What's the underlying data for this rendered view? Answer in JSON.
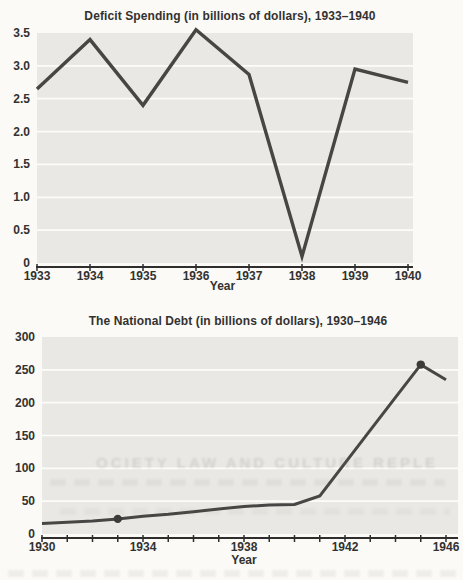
{
  "page": {
    "background_color": "#fbfaf7",
    "bleed_text": "OCIETY LAW AND CULTURE REPLE"
  },
  "colors": {
    "plot_bg": "#e9e8e4",
    "gridline": "#fcfcfa",
    "line": "#474644",
    "marker": "#3c3b39",
    "axis": "#2f2e2c",
    "text": "#333230"
  },
  "chart_data": [
    {
      "type": "line",
      "title": "Deficit Spending (in billions of dollars), 1933–1940",
      "xlabel": "Year",
      "ylabel": "",
      "x": [
        1933,
        1934,
        1935,
        1936,
        1937,
        1938,
        1939,
        1940
      ],
      "values": [
        2.65,
        3.4,
        2.4,
        3.55,
        2.87,
        0.1,
        2.95,
        2.75
      ],
      "x_labeled": [
        1933,
        1934,
        1935,
        1936,
        1937,
        1938,
        1939,
        1940
      ],
      "ylim": [
        0,
        3.5
      ],
      "yticks": [
        {
          "label": "3.5",
          "value": 3.5
        },
        {
          "label": "3.0",
          "value": 3.0
        },
        {
          "label": "2.5",
          "value": 2.5
        },
        {
          "label": "2.0",
          "value": 2.0
        },
        {
          "label": "1.5",
          "value": 1.5
        },
        {
          "label": "1.0",
          "value": 1.0
        },
        {
          "label": "0.5",
          "value": 0.5
        },
        {
          "label": "0",
          "value": 0
        }
      ],
      "grid": "horizontal white gridlines on gray panel",
      "legend": "none",
      "markers": []
    },
    {
      "type": "line",
      "title": "The National Debt (in billions of dollars), 1930–1946",
      "xlabel": "Year",
      "ylabel": "",
      "x": [
        1930,
        1931,
        1932,
        1933,
        1934,
        1935,
        1936,
        1937,
        1938,
        1939,
        1940,
        1941,
        1942,
        1943,
        1944,
        1945,
        1946
      ],
      "values": [
        16,
        18,
        20,
        23,
        27,
        30,
        34,
        38,
        42,
        44,
        45,
        58,
        108,
        158,
        208,
        258,
        235
      ],
      "x_labeled": [
        1930,
        1934,
        1938,
        1942,
        1946
      ],
      "ylim": [
        0,
        300
      ],
      "yticks": [
        {
          "label": "300",
          "value": 300
        },
        {
          "label": "250",
          "value": 250
        },
        {
          "label": "200",
          "value": 200
        },
        {
          "label": "150",
          "value": 150
        },
        {
          "label": "100",
          "value": 100
        },
        {
          "label": "50",
          "value": 50
        },
        {
          "label": "0",
          "value": 0
        }
      ],
      "grid": "horizontal white gridlines on gray panel",
      "legend": "none",
      "markers": [
        {
          "x": 1933,
          "y": 23
        },
        {
          "x": 1945,
          "y": 258
        }
      ]
    }
  ]
}
